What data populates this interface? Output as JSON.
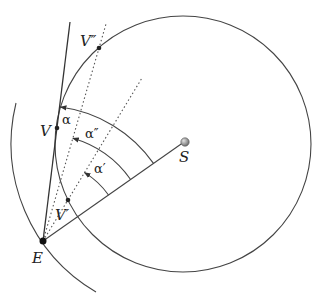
{
  "diagram": {
    "type": "geometry-orbit-elongation",
    "colors": {
      "stroke": "#333333",
      "background": "#ffffff",
      "sun_fill": "#8a8a8a"
    },
    "points": {
      "E": {
        "label": "E",
        "x": 43,
        "y": 241
      },
      "S": {
        "label": "S",
        "x": 184,
        "y": 142
      },
      "V": {
        "label": "V",
        "x": 57,
        "y": 128
      },
      "V_prime": {
        "label": "V′",
        "x": 68,
        "y": 200
      },
      "V_double_prime": {
        "label": "V″",
        "x": 99,
        "y": 48
      }
    },
    "angles": {
      "alpha": {
        "label": "α"
      },
      "alpha_double_prime": {
        "label": "α″"
      },
      "alpha_prime": {
        "label": "α′"
      }
    },
    "circles": {
      "venus_orbit": {
        "cx": 183,
        "cy": 144,
        "r": 128
      },
      "earth_orbit_arc": {
        "cx": 184,
        "cy": 142,
        "r": 172
      }
    }
  }
}
